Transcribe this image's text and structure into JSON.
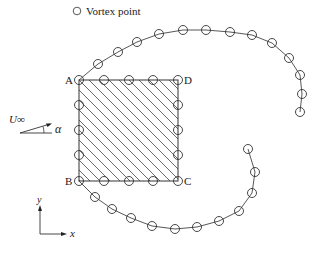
{
  "legend": {
    "marker": "circle",
    "label": "Vortex point"
  },
  "body": {
    "shape": "square",
    "hatched": true,
    "corners": [
      {
        "name": "A",
        "x": 79,
        "y": 80
      },
      {
        "name": "D",
        "x": 178,
        "y": 80
      },
      {
        "name": "C",
        "x": 178,
        "y": 181
      },
      {
        "name": "B",
        "x": 79,
        "y": 181
      }
    ],
    "corner_labels": {
      "A": "A",
      "B": "B",
      "C": "C",
      "D": "D"
    }
  },
  "freestream": {
    "velocity_label": "U∞",
    "angle_label": "α"
  },
  "axes": {
    "x_label": "x",
    "y_label": "y"
  },
  "vortex_points": {
    "square_edges": [
      [
        79,
        80
      ],
      [
        104,
        80
      ],
      [
        129,
        80
      ],
      [
        153,
        80
      ],
      [
        178,
        80
      ],
      [
        79,
        105
      ],
      [
        79,
        130
      ],
      [
        79,
        155
      ],
      [
        178,
        105
      ],
      [
        178,
        130
      ],
      [
        178,
        155
      ],
      [
        79,
        181
      ],
      [
        104,
        181
      ],
      [
        129,
        181
      ],
      [
        153,
        181
      ],
      [
        178,
        181
      ]
    ],
    "upper_wake": [
      [
        98,
        64
      ],
      [
        118,
        52
      ],
      [
        137,
        42
      ],
      [
        159,
        34
      ],
      [
        183,
        30
      ],
      [
        206,
        30
      ],
      [
        230,
        32
      ],
      [
        252,
        35
      ],
      [
        272,
        43
      ],
      [
        289,
        58
      ],
      [
        300,
        75
      ],
      [
        302,
        94
      ],
      [
        300,
        112
      ]
    ],
    "lower_wake": [
      [
        95,
        197
      ],
      [
        112,
        209
      ],
      [
        131,
        218
      ],
      [
        152,
        226
      ],
      [
        175,
        229
      ],
      [
        197,
        227
      ],
      [
        219,
        221
      ],
      [
        239,
        211
      ],
      [
        252,
        193
      ],
      [
        255,
        172
      ],
      [
        248,
        149
      ]
    ]
  },
  "colors": {
    "stroke": "#333333",
    "background": "#ffffff"
  }
}
